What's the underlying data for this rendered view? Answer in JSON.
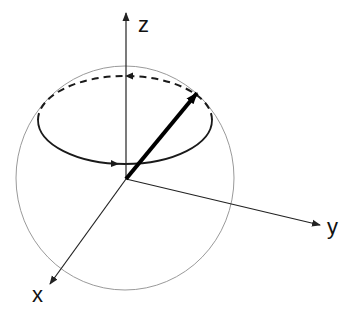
{
  "diagram": {
    "title": "",
    "type": "bloch-sphere-precession",
    "axes": {
      "z": {
        "label": "z"
      },
      "y": {
        "label": "y"
      },
      "x": {
        "label": "x"
      }
    },
    "colors": {
      "axis": "#222222",
      "sphere": "#9a9a9a",
      "vector": "#000000",
      "orbit": "#1a1a1a"
    },
    "elements": [
      "sphere-outline",
      "z-axis",
      "y-axis",
      "x-axis",
      "precession-orbit-front",
      "precession-orbit-back-dashed",
      "state-vector"
    ]
  }
}
